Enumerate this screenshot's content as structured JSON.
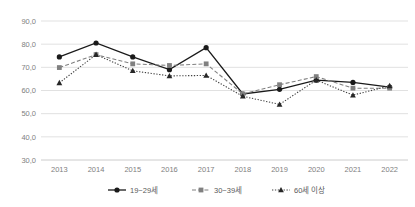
{
  "chart_data": {
    "type": "line",
    "title": "",
    "subtitle": "",
    "xlabel": "",
    "ylabel": "",
    "categories": [
      "2013",
      "2014",
      "2015",
      "2016",
      "2017",
      "2018",
      "2019",
      "2020",
      "2021",
      "2022"
    ],
    "x": [
      2013,
      2014,
      2015,
      2016,
      2017,
      2018,
      2019,
      2020,
      2021,
      2022
    ],
    "ylim": [
      30.0,
      90.0
    ],
    "yticks": [
      30.0,
      40.0,
      50.0,
      60.0,
      70.0,
      80.0,
      90.0
    ],
    "ytick_labels": [
      "30,0",
      "40,0",
      "50,0",
      "60,0",
      "70,0",
      "80,0",
      "90,0"
    ],
    "grid": true,
    "legend_position": "bottom",
    "series": [
      {
        "name": "19~29세",
        "marker": "circle",
        "line_style": "solid",
        "color": "#1a1a1a",
        "values": [
          74.5,
          80.5,
          74.5,
          69.0,
          78.5,
          58.5,
          60.5,
          64.5,
          63.5,
          61.5
        ]
      },
      {
        "name": "30~39세",
        "marker": "square",
        "line_style": "dashed",
        "color": "#808080",
        "values": [
          69.9,
          75.5,
          71.5,
          70.8,
          71.5,
          58.5,
          62.5,
          66.0,
          61.0,
          61.0
        ]
      },
      {
        "name": "60세 이상",
        "marker": "triangle",
        "line_style": "dotted",
        "color": "#262626",
        "values": [
          63.3,
          75.5,
          68.5,
          66.3,
          66.5,
          57.5,
          54.0,
          64.5,
          58.0,
          62.0
        ]
      }
    ]
  },
  "legend": {
    "items": [
      {
        "label": "19~29세",
        "marker": "circle-marker-icon"
      },
      {
        "label": "30~39세",
        "marker": "square-marker-icon"
      },
      {
        "label": "60세 이상",
        "marker": "triangle-marker-icon"
      }
    ]
  }
}
